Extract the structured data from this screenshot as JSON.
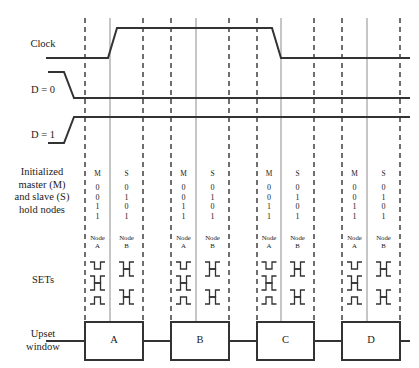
{
  "figure": {
    "type": "timing-diagram",
    "width": 419,
    "height": 368,
    "background": "#ffffff",
    "line_color": "#333333",
    "text_color": "#1b1b1b"
  },
  "row_labels": {
    "clock": "Clock",
    "d_zero": "D = 0",
    "d_one": "D = 1",
    "hold_nodes": "Initialized\nmaster (M)\nand slave (S)\nhold nodes",
    "sets": "SETs",
    "upset_window": "Upset\nwindow"
  },
  "columns": {
    "master_header": "M",
    "slave_header": "S",
    "node_a_header": "Node\nA",
    "node_b_header": "Node\nB"
  },
  "hold_values": {
    "master": "0\n0\n1\n1",
    "slave": "0\n1\n0\n1",
    "master_list": [
      0,
      0,
      1,
      1
    ],
    "slave_list": [
      0,
      1,
      0,
      1
    ]
  },
  "groups": [
    {
      "id": "group-a",
      "upset_label": "A",
      "master_header": "M",
      "slave_header": "S",
      "master_values": "0\n0\n1\n1",
      "slave_values": "0\n1\n0\n1",
      "node_a_header": "Node\nA",
      "node_b_header": "Node\nB",
      "node_a_sets": [
        0,
        0,
        1,
        1
      ],
      "node_b_sets": [
        0,
        1,
        0,
        1
      ]
    },
    {
      "id": "group-b",
      "upset_label": "B",
      "master_header": "M",
      "slave_header": "S",
      "master_values": "0\n0\n1\n1",
      "slave_values": "0\n1\n0\n1",
      "node_a_header": "Node\nA",
      "node_b_header": "Node\nB",
      "node_a_sets": [
        0,
        0,
        1,
        1
      ],
      "node_b_sets": [
        0,
        1,
        0,
        1
      ]
    },
    {
      "id": "group-c",
      "upset_label": "C",
      "master_header": "M",
      "slave_header": "S",
      "master_values": "0\n0\n1\n1",
      "slave_values": "0\n1\n0\n1",
      "node_a_header": "Node\nA",
      "node_b_header": "Node\nB",
      "node_a_sets": [
        0,
        0,
        1,
        1
      ],
      "node_b_sets": [
        0,
        1,
        0,
        1
      ]
    },
    {
      "id": "group-d",
      "upset_label": "D",
      "master_header": "M",
      "slave_header": "S",
      "master_values": "0\n0\n1\n1",
      "slave_values": "0\n1\n0\n1",
      "node_a_header": "Node\nA",
      "node_b_header": "Node\nB",
      "node_a_sets": [
        0,
        0,
        1,
        1
      ],
      "node_b_sets": [
        0,
        1,
        0,
        1
      ]
    }
  ],
  "waveforms": {
    "clock": {
      "name": "Clock",
      "low_y": 58,
      "high_y": 28,
      "rise_x": 108,
      "fall_x": 272,
      "start_x": 46,
      "end_x": 410
    },
    "d_zero": {
      "name": "D = 0",
      "high_y": 72,
      "low_y": 98,
      "fall_x": 78,
      "start_x": 48,
      "end_x": 410
    },
    "d_one": {
      "name": "D = 1",
      "low_y": 143,
      "high_y": 117,
      "rise_x": 78,
      "start_x": 48,
      "end_x": 410
    }
  },
  "guides": {
    "dashed_x": [
      85,
      143,
      171,
      229,
      257,
      314,
      342,
      400
    ],
    "solid_x": [
      110,
      196,
      281,
      367
    ],
    "dash_top": 18,
    "dash_bottom": 322
  }
}
